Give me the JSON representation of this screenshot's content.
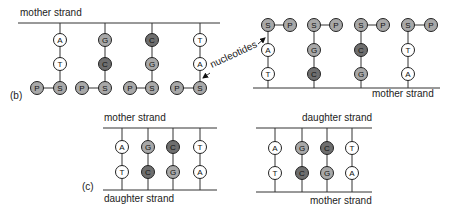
{
  "colors": {
    "light": "#ffffff",
    "medium": "#a8a8a8",
    "dark": "#6e6e6e",
    "stroke": "#222222"
  },
  "panel_b": {
    "label": "(b)",
    "annotation": "nucleotides",
    "left": {
      "strand_label": "mother strand",
      "columns": [
        {
          "top": "A",
          "mid": "T",
          "sugar": "S",
          "phosphate": "P"
        },
        {
          "top": "G",
          "mid": "C",
          "sugar": "S",
          "phosphate": "P"
        },
        {
          "top": "C",
          "mid": "G",
          "sugar": "S",
          "phosphate": "P"
        },
        {
          "top": "T",
          "mid": "A",
          "sugar": "S",
          "phosphate": "P"
        }
      ]
    },
    "right": {
      "strand_label": "mother strand",
      "columns": [
        {
          "sugar": "S",
          "phosphate": "P",
          "upper": "A",
          "lower": "T"
        },
        {
          "sugar": "S",
          "phosphate": "P",
          "upper": "G",
          "lower": "C"
        },
        {
          "sugar": "S",
          "phosphate": "P",
          "upper": "C",
          "lower": "G"
        },
        {
          "sugar": "S",
          "phosphate": "P",
          "upper": "T",
          "lower": "A"
        }
      ]
    }
  },
  "panel_c": {
    "label": "(c)",
    "left": {
      "top_strand_label": "mother strand",
      "bottom_strand_label": "daughter strand",
      "pairs": [
        [
          "A",
          "T"
        ],
        [
          "G",
          "C"
        ],
        [
          "C",
          "G"
        ],
        [
          "T",
          "A"
        ]
      ]
    },
    "right": {
      "top_strand_label": "daughter strand",
      "bottom_strand_label": "mother strand",
      "pairs": [
        [
          "A",
          "T"
        ],
        [
          "G",
          "C"
        ],
        [
          "C",
          "G"
        ],
        [
          "T",
          "A"
        ]
      ]
    }
  }
}
